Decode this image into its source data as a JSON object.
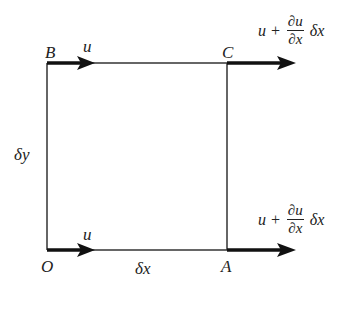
{
  "diagram": {
    "type": "fluid element velocity diagram",
    "points": {
      "O": "O",
      "A": "A",
      "B": "B",
      "C": "C"
    },
    "dimensions": {
      "horizontal": "δx",
      "vertical": "δy"
    },
    "velocities": {
      "left": "u",
      "right": {
        "base": "u +",
        "num": "∂u",
        "den": "∂x",
        "suffix": "δx"
      }
    }
  }
}
